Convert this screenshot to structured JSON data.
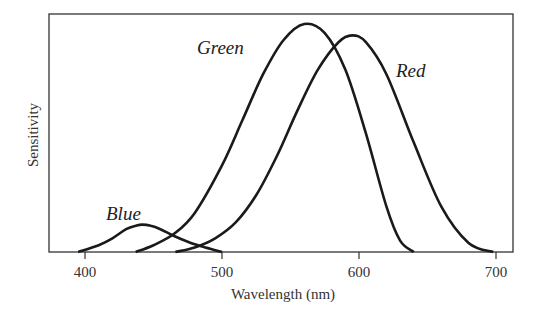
{
  "chart_data": {
    "type": "line",
    "title": "",
    "xlabel": "Wavelength (nm)",
    "ylabel": "Sensitivity",
    "xlim": [
      371,
      711
    ],
    "ylim": [
      0,
      1.0
    ],
    "xticks": [
      400,
      500,
      600,
      700
    ],
    "xtick_labels": [
      "400",
      "500",
      "600",
      "700"
    ],
    "yticks": [],
    "grid": false,
    "legend": "none (curves labeled directly)",
    "series": [
      {
        "name": "Blue",
        "label_text": "Blue",
        "x": [
          395,
          410,
          420,
          430,
          437,
          442,
          448,
          455,
          465,
          475,
          485,
          495,
          500
        ],
        "y": [
          0.0,
          0.03,
          0.06,
          0.1,
          0.115,
          0.12,
          0.115,
          0.1,
          0.07,
          0.045,
          0.025,
          0.008,
          0.0
        ]
      },
      {
        "name": "Green",
        "label_text": "Green",
        "x": [
          437,
          450,
          465,
          480,
          500,
          515,
          530,
          545,
          560,
          575,
          590,
          605,
          620,
          630,
          640
        ],
        "y": [
          0.0,
          0.03,
          0.08,
          0.17,
          0.38,
          0.58,
          0.78,
          0.93,
          1.0,
          0.96,
          0.8,
          0.52,
          0.2,
          0.05,
          0.0
        ]
      },
      {
        "name": "Red",
        "label_text": "Red",
        "x": [
          466,
          480,
          495,
          510,
          525,
          540,
          555,
          570,
          585,
          595,
          605,
          620,
          640,
          660,
          680,
          698
        ],
        "y": [
          0.0,
          0.02,
          0.06,
          0.13,
          0.25,
          0.42,
          0.62,
          0.8,
          0.92,
          0.95,
          0.92,
          0.78,
          0.48,
          0.2,
          0.04,
          0.0
        ]
      }
    ]
  },
  "labels": {
    "blue": "Blue",
    "green": "Green",
    "red": "Red",
    "xlabel": "Wavelength (nm)",
    "ylabel": "Sensitivity",
    "ticks": [
      "400",
      "500",
      "600",
      "700"
    ]
  }
}
